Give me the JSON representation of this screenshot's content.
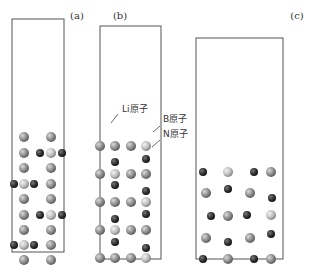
{
  "panels": [
    {
      "label": "(a)",
      "label_pos": [
        77,
        19
      ],
      "box": [
        12,
        19,
        52,
        233
      ]
    },
    {
      "label": "(b)",
      "label_pos": [
        120,
        19
      ],
      "box": [
        100,
        26,
        61,
        233
      ]
    },
    {
      "label": "(c)",
      "label_pos": [
        297,
        19
      ],
      "box": [
        196,
        38,
        87,
        221
      ]
    }
  ],
  "annotations": [
    {
      "text": "Li原子",
      "pos": [
        122,
        112
      ],
      "line": [
        118,
        114,
        111,
        123
      ]
    },
    {
      "text": "B原子",
      "pos": [
        163,
        122
      ],
      "line": [
        160,
        126,
        153,
        132
      ]
    },
    {
      "text": "N原子",
      "pos": [
        163,
        137
      ],
      "line": [
        160,
        140,
        152,
        147
      ]
    }
  ],
  "legend": {
    "li": "Li原子",
    "b": "B原子",
    "n": "N原子"
  },
  "colors": {
    "li": "#8a8a8a",
    "b": "#bdbdbd",
    "n": "#2f2f2f",
    "box": "#555555"
  },
  "atoms": {
    "a": [
      [
        "li",
        24,
        137
      ],
      [
        "li",
        51,
        137
      ],
      [
        "li",
        24,
        153
      ],
      [
        "n",
        40,
        153
      ],
      [
        "b",
        51,
        153
      ],
      [
        "n",
        62,
        153
      ],
      [
        "li",
        24,
        168
      ],
      [
        "li",
        51,
        168
      ],
      [
        "n",
        14,
        184
      ],
      [
        "b",
        24,
        184
      ],
      [
        "n",
        34,
        184
      ],
      [
        "li",
        51,
        184
      ],
      [
        "li",
        24,
        199
      ],
      [
        "li",
        51,
        199
      ],
      [
        "li",
        24,
        215
      ],
      [
        "n",
        40,
        215
      ],
      [
        "b",
        51,
        215
      ],
      [
        "n",
        62,
        215
      ],
      [
        "li",
        24,
        230
      ],
      [
        "li",
        51,
        230
      ],
      [
        "n",
        14,
        245
      ],
      [
        "b",
        24,
        245
      ],
      [
        "n",
        34,
        245
      ],
      [
        "li",
        51,
        245
      ],
      [
        "li",
        24,
        260
      ],
      [
        "li",
        51,
        260
      ]
    ],
    "b": [
      [
        "li",
        100,
        146
      ],
      [
        "li",
        115,
        146
      ],
      [
        "li",
        131,
        146
      ],
      [
        "b",
        146,
        146
      ],
      [
        "n",
        115,
        162
      ],
      [
        "n",
        146,
        159
      ],
      [
        "li",
        100,
        174
      ],
      [
        "b",
        115,
        174
      ],
      [
        "li",
        131,
        174
      ],
      [
        "li",
        146,
        174
      ],
      [
        "n",
        115,
        185
      ],
      [
        "n",
        146,
        191
      ],
      [
        "li",
        100,
        202
      ],
      [
        "li",
        115,
        202
      ],
      [
        "li",
        131,
        202
      ],
      [
        "b",
        146,
        202
      ],
      [
        "n",
        115,
        219
      ],
      [
        "n",
        146,
        214
      ],
      [
        "li",
        100,
        230
      ],
      [
        "b",
        115,
        230
      ],
      [
        "li",
        131,
        230
      ],
      [
        "li",
        146,
        230
      ],
      [
        "n",
        115,
        242
      ],
      [
        "n",
        146,
        248
      ],
      [
        "li",
        100,
        258
      ],
      [
        "li",
        115,
        258
      ],
      [
        "li",
        131,
        258
      ],
      [
        "b",
        146,
        258
      ]
    ],
    "c": [
      [
        "n",
        203,
        172
      ],
      [
        "b",
        228,
        172
      ],
      [
        "n",
        254,
        172
      ],
      [
        "li",
        271,
        172
      ],
      [
        "li",
        206,
        193
      ],
      [
        "n",
        228,
        189
      ],
      [
        "li",
        250,
        193
      ],
      [
        "n",
        272,
        198
      ],
      [
        "n",
        211,
        216
      ],
      [
        "li",
        228,
        216
      ],
      [
        "n",
        247,
        215
      ],
      [
        "b",
        271,
        215
      ],
      [
        "li",
        206,
        238
      ],
      [
        "n",
        228,
        242
      ],
      [
        "li",
        250,
        238
      ],
      [
        "n",
        271,
        234
      ],
      [
        "n",
        203,
        259
      ],
      [
        "li",
        228,
        259
      ],
      [
        "n",
        254,
        259
      ],
      [
        "li",
        271,
        259
      ]
    ]
  }
}
